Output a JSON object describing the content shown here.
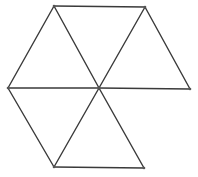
{
  "diagram": {
    "title": "",
    "stroke_color": "#3a3a3a",
    "stroke_width": 1.4,
    "vertex_color": "#555555",
    "vertices": [
      {
        "id": "top_left",
        "x": 54,
        "y": 6
      },
      {
        "id": "top_right",
        "x": 145,
        "y": 7
      },
      {
        "id": "left",
        "x": 8,
        "y": 88
      },
      {
        "id": "center",
        "x": 99,
        "y": 88
      },
      {
        "id": "right",
        "x": 190,
        "y": 89
      },
      {
        "id": "bottom_left",
        "x": 54,
        "y": 167
      },
      {
        "id": "bottom_right",
        "x": 144,
        "y": 168
      }
    ],
    "edges": [
      [
        "top_left",
        "top_right"
      ],
      [
        "top_left",
        "left"
      ],
      [
        "top_left",
        "center"
      ],
      [
        "top_right",
        "center"
      ],
      [
        "top_right",
        "right"
      ],
      [
        "left",
        "center"
      ],
      [
        "center",
        "right"
      ],
      [
        "left",
        "bottom_left"
      ],
      [
        "center",
        "bottom_left"
      ],
      [
        "center",
        "bottom_right"
      ],
      [
        "bottom_left",
        "bottom_right"
      ]
    ]
  }
}
